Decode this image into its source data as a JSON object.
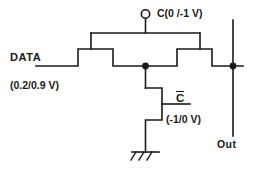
{
  "diagram": {
    "stroke_color": "#1a1a1a",
    "background_color": "#ffffff",
    "labels": {
      "data": "DATA",
      "data_voltage": "(0.2/0.9 V)",
      "clock": "C(0 /-1 V)",
      "clock_bar_symbol": "C",
      "clock_bar_voltage": "(-1/0 V)",
      "out": "Out"
    },
    "nodes": {
      "clock_terminal": "clock-terminal-circle",
      "input_node": "data-input-line",
      "center_junction": "center-junction-dot",
      "output_junction": "output-junction-dot",
      "ground": "ground-symbol"
    },
    "devices": [
      {
        "name": "left-pass-transistor",
        "gate": "C"
      },
      {
        "name": "right-pass-transistor",
        "gate": "C"
      },
      {
        "name": "pulldown-transistor",
        "gate": "C-bar"
      }
    ]
  }
}
